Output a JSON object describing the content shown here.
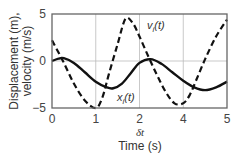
{
  "chart_data": {
    "type": "line",
    "title": "",
    "xlabel": "Time (s)",
    "ylabel_line1": "Displacement (m),",
    "ylabel_line2": "velocity (m/s)",
    "x_tick_labels": [
      "0",
      "1",
      "2",
      "4",
      "5"
    ],
    "x_tick_positions": [
      0,
      1,
      2,
      3,
      4
    ],
    "y_tick_labels": [
      "5",
      "0",
      "−5"
    ],
    "y_ticks": [
      5,
      0,
      -5
    ],
    "ylim": [
      -5,
      5
    ],
    "xlim_positions": [
      0,
      4
    ],
    "grid": true,
    "annotation_below_axis": "δt",
    "annotation_below_axis_position": 2,
    "series": [
      {
        "name": "v_i(t)",
        "label_main": "v",
        "label_sub": "i",
        "label_suffix": "(t)",
        "style": "dashed",
        "color": "#111111",
        "x": [
          0,
          0.25,
          0.5,
          0.75,
          1.0,
          1.15,
          1.3,
          1.5,
          1.68,
          1.85,
          2.0,
          2.2,
          2.4,
          2.6,
          2.8,
          3.0,
          3.15,
          3.3,
          3.5,
          3.75,
          4.0
        ],
        "y": [
          2.2,
          0.0,
          -2.4,
          -4.2,
          -5.0,
          -3.9,
          -1.4,
          1.8,
          4.5,
          4.0,
          2.6,
          0.5,
          -1.5,
          -3.3,
          -4.5,
          -4.5,
          -3.6,
          -2.0,
          0.2,
          2.6,
          4.4
        ]
      },
      {
        "name": "x_i(t)",
        "label_main": "x",
        "label_sub": "i",
        "label_suffix": "(t)",
        "style": "solid",
        "color": "#111111",
        "x": [
          0,
          0.15,
          0.27,
          0.5,
          0.75,
          1.0,
          1.25,
          1.4,
          1.6,
          1.8,
          2.0,
          2.25,
          2.5,
          2.75,
          3.0,
          3.25,
          3.5,
          3.75,
          4.0
        ],
        "y": [
          0.0,
          0.25,
          0.3,
          -0.2,
          -1.2,
          -2.2,
          -2.8,
          -2.9,
          -2.4,
          -1.3,
          -0.2,
          0.2,
          -0.3,
          -1.2,
          -2.1,
          -2.8,
          -3.1,
          -2.8,
          -2.2
        ]
      }
    ]
  }
}
